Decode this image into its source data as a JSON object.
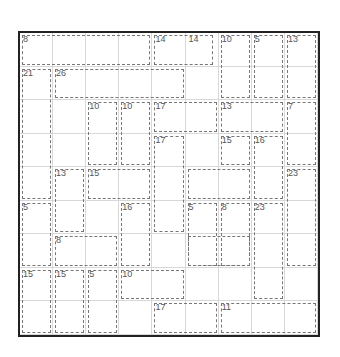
{
  "puzzle": {
    "type": "killer-sudoku",
    "size": 9,
    "clues": [
      {
        "r": 0,
        "c": 0,
        "v": "8"
      },
      {
        "r": 0,
        "c": 4,
        "v": "14"
      },
      {
        "r": 0,
        "c": 5,
        "v": "14"
      },
      {
        "r": 0,
        "c": 6,
        "v": "10"
      },
      {
        "r": 0,
        "c": 7,
        "v": "5"
      },
      {
        "r": 0,
        "c": 8,
        "v": "13"
      },
      {
        "r": 1,
        "c": 0,
        "v": "21"
      },
      {
        "r": 1,
        "c": 1,
        "v": "26"
      },
      {
        "r": 2,
        "c": 2,
        "v": "10"
      },
      {
        "r": 2,
        "c": 3,
        "v": "10"
      },
      {
        "r": 2,
        "c": 4,
        "v": "17"
      },
      {
        "r": 2,
        "c": 6,
        "v": "13"
      },
      {
        "r": 2,
        "c": 8,
        "v": "7"
      },
      {
        "r": 3,
        "c": 4,
        "v": "17"
      },
      {
        "r": 3,
        "c": 6,
        "v": "15"
      },
      {
        "r": 3,
        "c": 7,
        "v": "16"
      },
      {
        "r": 4,
        "c": 1,
        "v": "13"
      },
      {
        "r": 4,
        "c": 2,
        "v": "15"
      },
      {
        "r": 4,
        "c": 8,
        "v": "23"
      },
      {
        "r": 5,
        "c": 0,
        "v": "5"
      },
      {
        "r": 5,
        "c": 3,
        "v": "16"
      },
      {
        "r": 5,
        "c": 5,
        "v": "5"
      },
      {
        "r": 5,
        "c": 6,
        "v": "8"
      },
      {
        "r": 5,
        "c": 7,
        "v": "23"
      },
      {
        "r": 6,
        "c": 1,
        "v": "8"
      },
      {
        "r": 7,
        "c": 0,
        "v": "15"
      },
      {
        "r": 7,
        "c": 1,
        "v": "15"
      },
      {
        "r": 7,
        "c": 2,
        "v": "5"
      },
      {
        "r": 7,
        "c": 3,
        "v": "10"
      },
      {
        "r": 8,
        "c": 4,
        "v": "17"
      },
      {
        "r": 8,
        "c": 6,
        "v": "11"
      }
    ],
    "cages": [
      {
        "r": 0,
        "c": 0,
        "w": 4,
        "h": 1
      },
      {
        "r": 0,
        "c": 4,
        "w": 1.9,
        "h": 1
      },
      {
        "r": 0,
        "c": 6,
        "w": 1,
        "h": 2
      },
      {
        "r": 0,
        "c": 7,
        "w": 1,
        "h": 2
      },
      {
        "r": 0,
        "c": 8,
        "w": 1,
        "h": 2
      },
      {
        "r": 1,
        "c": 0,
        "w": 1,
        "h": 4
      },
      {
        "r": 1,
        "c": 1,
        "w": 4,
        "h": 1
      },
      {
        "r": 2,
        "c": 2,
        "w": 1,
        "h": 2
      },
      {
        "r": 2,
        "c": 3,
        "w": 1,
        "h": 2
      },
      {
        "r": 2,
        "c": 4,
        "w": 2,
        "h": 1
      },
      {
        "r": 2,
        "c": 6,
        "w": 2,
        "h": 1
      },
      {
        "r": 2,
        "c": 8,
        "w": 1,
        "h": 2
      },
      {
        "r": 3,
        "c": 4,
        "w": 1,
        "h": 3
      },
      {
        "r": 3,
        "c": 6,
        "w": 1,
        "h": 1
      },
      {
        "r": 3,
        "c": 7,
        "w": 1,
        "h": 2
      },
      {
        "r": 4,
        "c": 1,
        "w": 1,
        "h": 2
      },
      {
        "r": 4,
        "c": 2,
        "w": 2,
        "h": 1
      },
      {
        "r": 4,
        "c": 5,
        "w": 2,
        "h": 1
      },
      {
        "r": 4,
        "c": 8,
        "w": 1,
        "h": 3
      },
      {
        "r": 5,
        "c": 0,
        "w": 1,
        "h": 2
      },
      {
        "r": 5,
        "c": 3,
        "w": 1,
        "h": 2
      },
      {
        "r": 5,
        "c": 5,
        "w": 1,
        "h": 2
      },
      {
        "r": 5,
        "c": 6,
        "w": 1,
        "h": 2
      },
      {
        "r": 5,
        "c": 7,
        "w": 1,
        "h": 3
      },
      {
        "r": 6,
        "c": 1,
        "w": 2,
        "h": 1
      },
      {
        "r": 6,
        "c": 5,
        "w": 2,
        "h": 1
      },
      {
        "r": 7,
        "c": 0,
        "w": 1,
        "h": 2
      },
      {
        "r": 7,
        "c": 1,
        "w": 1,
        "h": 2
      },
      {
        "r": 7,
        "c": 2,
        "w": 1,
        "h": 2
      },
      {
        "r": 7,
        "c": 3,
        "w": 2,
        "h": 1
      },
      {
        "r": 8,
        "c": 4,
        "w": 2,
        "h": 1
      },
      {
        "r": 8,
        "c": 6,
        "w": 3,
        "h": 1
      }
    ]
  }
}
